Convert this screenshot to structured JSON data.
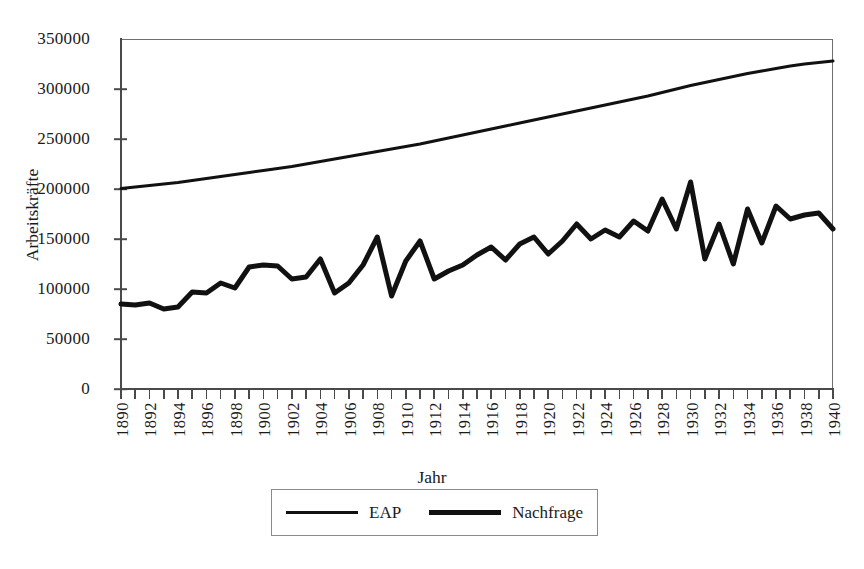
{
  "chart_data": {
    "type": "line",
    "title": "",
    "xlabel": "Jahr",
    "ylabel": "Arbeitskräfte",
    "xlim": [
      1890,
      1940
    ],
    "ylim": [
      0,
      350000
    ],
    "grid": false,
    "legend_position": "bottom",
    "y_ticks": [
      0,
      50000,
      100000,
      150000,
      200000,
      250000,
      300000,
      350000
    ],
    "y_tick_labels": [
      "0",
      "50000",
      "100000",
      "150000",
      "200000",
      "250000",
      "300000",
      "350000"
    ],
    "x_tick_labels": [
      "1890",
      "1892",
      "1894",
      "1896",
      "1898",
      "1900",
      "1902",
      "1904",
      "1906",
      "1908",
      "1910",
      "1912",
      "1914",
      "1916",
      "1918",
      "1920",
      "1922",
      "1924",
      "1926",
      "1928",
      "1930",
      "1932",
      "1934",
      "1936",
      "1938",
      "1940"
    ],
    "x": [
      1890,
      1891,
      1892,
      1893,
      1894,
      1895,
      1896,
      1897,
      1898,
      1899,
      1900,
      1901,
      1902,
      1903,
      1904,
      1905,
      1906,
      1907,
      1908,
      1909,
      1910,
      1911,
      1912,
      1913,
      1914,
      1915,
      1916,
      1917,
      1918,
      1919,
      1920,
      1921,
      1922,
      1923,
      1924,
      1925,
      1926,
      1927,
      1928,
      1929,
      1930,
      1931,
      1932,
      1933,
      1934,
      1935,
      1936,
      1937,
      1938,
      1939,
      1940
    ],
    "series": [
      {
        "name": "EAP",
        "line_width": 3,
        "color": "#111111",
        "values": [
          200500,
          202000,
          203500,
          205000,
          206500,
          208500,
          210500,
          212500,
          214500,
          216500,
          218500,
          220500,
          222500,
          225000,
          227500,
          230000,
          232500,
          235000,
          237500,
          240000,
          242500,
          245000,
          248000,
          251000,
          254000,
          257000,
          260000,
          263000,
          266000,
          269000,
          272000,
          275000,
          278000,
          281000,
          284000,
          287000,
          290000,
          293000,
          296500,
          300000,
          303500,
          306500,
          309500,
          312500,
          315500,
          318000,
          320500,
          323000,
          325000,
          326500,
          328000
        ]
      },
      {
        "name": "Nachfrage",
        "line_width": 5,
        "color": "#111111",
        "values": [
          85000,
          84000,
          86000,
          80000,
          82000,
          97000,
          96000,
          106000,
          101000,
          122000,
          124000,
          123000,
          110000,
          112000,
          130000,
          96000,
          106000,
          124000,
          152000,
          93000,
          128000,
          148000,
          110000,
          118000,
          124000,
          134000,
          142000,
          129000,
          145000,
          152000,
          135000,
          148000,
          165000,
          150000,
          159000,
          152000,
          168000,
          158000,
          190000,
          160000,
          207000,
          130000,
          165000,
          125000,
          180000,
          146000,
          183000,
          170000,
          174000,
          176000,
          160000
        ]
      }
    ]
  },
  "legend": {
    "items": [
      {
        "label": "EAP",
        "style": "eap"
      },
      {
        "label": "Nachfrage",
        "style": "nach"
      }
    ]
  }
}
